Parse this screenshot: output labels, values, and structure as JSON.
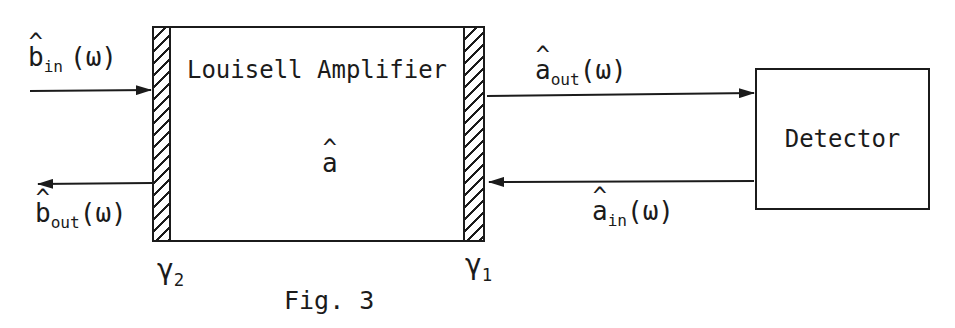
{
  "figure": {
    "caption": "Fig. 3",
    "amplifier_label": "Louisell Amplifier",
    "detector_label": "Detector"
  },
  "labels": {
    "b_in": {
      "hat": "^",
      "base": "b",
      "sub": "in",
      "arg": "(ω)"
    },
    "b_out": {
      "hat": "^",
      "base": "b",
      "sub": "out",
      "arg": "(ω)"
    },
    "a_out": {
      "hat": "^",
      "base": "a",
      "sub": "out",
      "arg": "(ω)"
    },
    "a_in": {
      "hat": "^",
      "base": "a",
      "sub": "in",
      "arg": "(ω)"
    },
    "a_cavity": {
      "hat": "^",
      "base": "a"
    },
    "gamma_left": {
      "base": "γ",
      "sub": "2"
    },
    "gamma_right": {
      "base": "γ",
      "sub": "1"
    }
  },
  "colors": {
    "ink": "#1b1b1b",
    "background": "#ffffff"
  }
}
